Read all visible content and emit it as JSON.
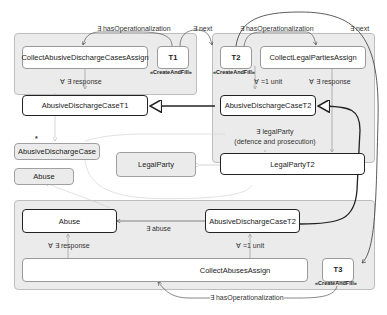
{
  "diagram": {
    "containers": [
      {
        "id": "T1",
        "label": "T1",
        "stereotype": "«CreateAndFill»"
      },
      {
        "id": "T2",
        "label": "T2",
        "stereotype": "«CreateAndFill»"
      },
      {
        "id": "T3",
        "label": "T3",
        "stereotype": "«CreateAndFill»"
      }
    ],
    "nodes": {
      "collect_abusive": "CollectAbusiveDischargeCasesAssign",
      "adc_t1": "AbusiveDischargeCaseT1",
      "collect_legal": "CollectLegalPartiesAssign",
      "adc_t2": "AbusiveDischargeCaseT2",
      "legal_party_t2": "LegalPartyT2",
      "adc": "AbusiveDischargeCase",
      "abuse_class": "Abuse",
      "legal_party": "LegalParty",
      "abuse_t3": "Abuse",
      "adc_t2_t3": "AbusiveDischargeCaseT2",
      "collect_abuses": "CollectAbusesAssign"
    },
    "edges": {
      "has_op_1": "∃ hasOperationalization",
      "next_1": "∃ next",
      "has_op_2": "∃ hasOperationalization",
      "next_2": "∃ next",
      "response_1": "∀ ∃ response",
      "unit_1": "∀ =1 unit",
      "response_2": "∀ ∃ response",
      "legal_party_1": "∃ legalParty",
      "legal_party_2": "(defence and prosecution)",
      "abuse": "∃ abuse",
      "response_3": "∀ ∃ response",
      "unit_2": "∀ =1 unit",
      "has_op_3": "∃ hasOperationalization",
      "star": "*"
    }
  }
}
